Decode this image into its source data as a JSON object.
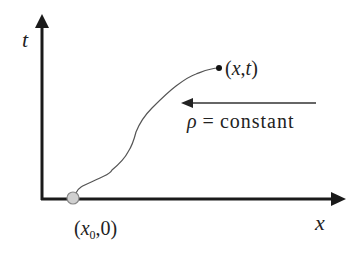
{
  "diagram": {
    "axes": {
      "t_label": "t",
      "x_label": "x"
    },
    "points": {
      "start_label_open": "(",
      "start_var": "x",
      "start_sub": "0",
      "start_rest": ",0)",
      "end_label": "(x,t)"
    },
    "annotation": {
      "rho_symbol": "ρ",
      "equals": "=",
      "text": "constant"
    },
    "colors": {
      "axis": "#1a1a1a",
      "curve": "#555555",
      "start_fill": "#d0d0d0",
      "end_fill": "#111111"
    }
  }
}
